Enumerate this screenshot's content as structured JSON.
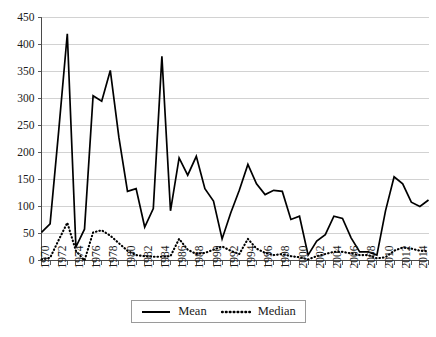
{
  "chart_data": {
    "type": "line",
    "title": "",
    "xlabel": "",
    "ylabel": "",
    "ylim": [
      0,
      450
    ],
    "ytick_step": 50,
    "yticks": [
      0,
      50,
      100,
      150,
      200,
      250,
      300,
      350,
      400,
      450
    ],
    "xlim": [
      1970,
      2015
    ],
    "xticks": [
      1970,
      1972,
      1974,
      1976,
      1978,
      1980,
      1982,
      1984,
      1986,
      1988,
      1990,
      1992,
      1994,
      1996,
      1998,
      2000,
      2002,
      2004,
      2006,
      2008,
      2010,
      2012,
      2014
    ],
    "grid": "horizontal",
    "legend_position": "bottom",
    "x": [
      1970,
      1971,
      1972,
      1973,
      1974,
      1975,
      1976,
      1977,
      1978,
      1979,
      1980,
      1981,
      1982,
      1983,
      1984,
      1985,
      1986,
      1987,
      1988,
      1989,
      1990,
      1991,
      1992,
      1993,
      1994,
      1995,
      1996,
      1997,
      1998,
      1999,
      2000,
      2001,
      2002,
      2003,
      2004,
      2005,
      2006,
      2007,
      2008,
      2009,
      2010,
      2011,
      2012,
      2013,
      2014,
      2015
    ],
    "series": [
      {
        "name": "Mean",
        "style": "solid",
        "color": "#000000",
        "values": [
          52,
          68,
          240,
          420,
          25,
          58,
          305,
          295,
          352,
          228,
          128,
          133,
          62,
          96,
          378,
          92,
          190,
          158,
          193,
          133,
          110,
          40,
          88,
          130,
          178,
          142,
          122,
          130,
          128,
          76,
          82,
          10,
          36,
          48,
          82,
          78,
          42,
          16,
          16,
          10,
          92,
          155,
          142,
          108,
          100,
          112
        ]
      },
      {
        "name": "Median",
        "style": "dotted",
        "color": "#000000",
        "values": [
          2,
          5,
          38,
          70,
          18,
          0,
          52,
          56,
          46,
          32,
          18,
          10,
          8,
          7,
          7,
          8,
          40,
          20,
          12,
          14,
          20,
          26,
          18,
          12,
          40,
          22,
          14,
          10,
          12,
          8,
          6,
          2,
          8,
          12,
          16,
          16,
          13,
          10,
          10,
          4,
          6,
          18,
          24,
          22,
          18,
          17
        ]
      }
    ]
  },
  "legend": {
    "entries": [
      {
        "label": "Mean",
        "style": "solid"
      },
      {
        "label": "Median",
        "style": "dotted"
      }
    ]
  },
  "axes": {
    "y_tick_labels": [
      "450",
      "400",
      "350",
      "300",
      "250",
      "200",
      "150",
      "100",
      "50",
      "0"
    ],
    "x_tick_labels": [
      "1970",
      "1972",
      "1974",
      "1976",
      "1978",
      "1980",
      "1982",
      "1984",
      "1986",
      "1988",
      "1990",
      "1992",
      "1994",
      "1996",
      "1998",
      "2000",
      "2002",
      "2004",
      "2006",
      "2008",
      "2010",
      "2012",
      "2014"
    ]
  }
}
